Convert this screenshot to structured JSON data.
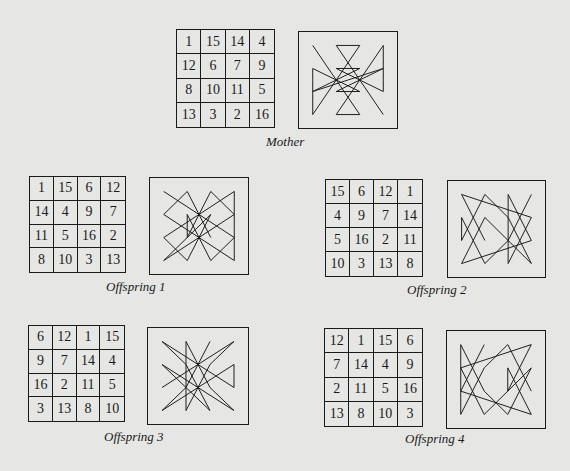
{
  "panels": [
    {
      "id": "mother",
      "caption": "Mother",
      "grid": [
        [
          1,
          15,
          14,
          4
        ],
        [
          12,
          6,
          7,
          9
        ],
        [
          8,
          10,
          11,
          5
        ],
        [
          13,
          3,
          2,
          16
        ]
      ],
      "layout": {
        "grid": [
          176,
          29,
          99,
          99
        ],
        "pattern": [
          298,
          31,
          100,
          98
        ],
        "caption": [
          266,
          134
        ]
      }
    },
    {
      "id": "offspring-1",
      "caption": "Offspring 1",
      "grid": [
        [
          1,
          15,
          6,
          12
        ],
        [
          14,
          4,
          9,
          7
        ],
        [
          11,
          5,
          16,
          2
        ],
        [
          8,
          10,
          3,
          13
        ]
      ],
      "layout": {
        "grid": [
          29,
          176,
          97,
          97
        ],
        "pattern": [
          149,
          177,
          100,
          98
        ],
        "caption": [
          106,
          279
        ]
      }
    },
    {
      "id": "offspring-2",
      "caption": "Offspring 2",
      "grid": [
        [
          15,
          6,
          12,
          1
        ],
        [
          4,
          9,
          7,
          14
        ],
        [
          5,
          16,
          2,
          11
        ],
        [
          10,
          3,
          13,
          8
        ]
      ],
      "layout": {
        "grid": [
          325,
          179,
          98,
          98
        ],
        "pattern": [
          447,
          180,
          99,
          98
        ],
        "caption": [
          407,
          282
        ]
      }
    },
    {
      "id": "offspring-3",
      "caption": "Offspring 3",
      "grid": [
        [
          6,
          12,
          1,
          15
        ],
        [
          9,
          7,
          14,
          4
        ],
        [
          16,
          2,
          11,
          5
        ],
        [
          3,
          13,
          8,
          10
        ]
      ],
      "layout": {
        "grid": [
          28,
          325,
          97,
          97
        ],
        "pattern": [
          147,
          327,
          102,
          98
        ],
        "caption": [
          104,
          429
        ]
      }
    },
    {
      "id": "offspring-4",
      "caption": "Offspring 4",
      "grid": [
        [
          12,
          1,
          15,
          6
        ],
        [
          7,
          14,
          4,
          9
        ],
        [
          2,
          11,
          5,
          16
        ],
        [
          13,
          8,
          10,
          3
        ]
      ],
      "layout": {
        "grid": [
          324,
          328,
          99,
          99
        ],
        "pattern": [
          446,
          330,
          100,
          99
        ],
        "caption": [
          405,
          431
        ]
      }
    }
  ]
}
